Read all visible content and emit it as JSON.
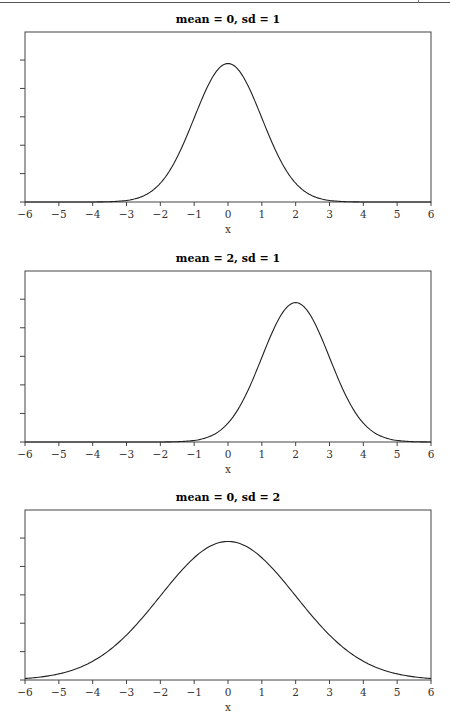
{
  "chart_data": [
    {
      "type": "line",
      "title": "mean = 0, sd = 1",
      "xlabel": "x",
      "ylabel": "",
      "distribution": "normal",
      "mean": 0,
      "sd": 1,
      "xlim": [
        -6,
        6
      ],
      "ylim": [
        0,
        0.4
      ],
      "x_ticks": [
        -6,
        -5,
        -4,
        -3,
        -2,
        -1,
        0,
        1,
        2,
        3,
        4,
        5,
        6
      ],
      "y_ticks_count": 6,
      "y_tick_labels_shown": false,
      "peak": {
        "x": 0,
        "y": 0.3989
      },
      "grid": false,
      "legend": null
    },
    {
      "type": "line",
      "title": "mean = 2, sd = 1",
      "xlabel": "x",
      "ylabel": "",
      "distribution": "normal",
      "mean": 2,
      "sd": 1,
      "xlim": [
        -6,
        6
      ],
      "ylim": [
        0,
        0.4
      ],
      "x_ticks": [
        -6,
        -5,
        -4,
        -3,
        -2,
        -1,
        0,
        1,
        2,
        3,
        4,
        5,
        6
      ],
      "y_ticks_count": 6,
      "y_tick_labels_shown": false,
      "peak": {
        "x": 2,
        "y": 0.3989
      },
      "grid": false,
      "legend": null
    },
    {
      "type": "line",
      "title": "mean = 0, sd = 2",
      "xlabel": "x",
      "ylabel": "",
      "distribution": "normal",
      "mean": 0,
      "sd": 2,
      "xlim": [
        -6,
        6
      ],
      "ylim": [
        0,
        0.2
      ],
      "x_ticks": [
        -6,
        -5,
        -4,
        -3,
        -2,
        -1,
        0,
        1,
        2,
        3,
        4,
        5,
        6
      ],
      "y_ticks_count": 6,
      "y_tick_labels_shown": false,
      "peak": {
        "x": 0,
        "y": 0.1995
      },
      "grid": false,
      "legend": null
    }
  ],
  "charts": [
    {
      "title": "mean = 0, sd = 1",
      "xlabel": "x"
    },
    {
      "title": "mean = 2, sd = 1",
      "xlabel": "x"
    },
    {
      "title": "mean = 0, sd = 2",
      "xlabel": "x"
    }
  ],
  "x_tick_labels": [
    "−6",
    "−5",
    "−4",
    "−3",
    "−2",
    "−1",
    "0",
    "1",
    "2",
    "3",
    "4",
    "5",
    "6"
  ]
}
